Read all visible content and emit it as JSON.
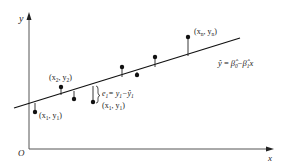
{
  "diagram": {
    "type": "linear-regression-residual-illustration",
    "axes": {
      "x_label": "x",
      "y_label": "y",
      "origin_label": "O"
    },
    "regression_line": {
      "equation": "ŷ = β̂₀−β̂₁x",
      "equation_parts": {
        "yhat": "ŷ",
        "eq": " = ",
        "b0": "β̂",
        "b0_sub": "0",
        "minus": "−",
        "b1": "β̂",
        "b1_sub": "1",
        "x": "x"
      }
    },
    "point_labels": {
      "p1": {
        "open": "(x",
        "sub1": "1",
        "mid": ", y",
        "sub2": "1",
        "close": ")"
      },
      "p2": {
        "open": "(x",
        "sub1": "2",
        "mid": ", y",
        "sub2": "2",
        "close": ")"
      },
      "pi": {
        "open": "(x",
        "sub1": "1",
        "mid": ", y",
        "sub2": "1",
        "close": ")"
      },
      "pn": {
        "open": "(x",
        "sub1": "n",
        "mid": ", y",
        "sub2": "n",
        "close": ")"
      }
    },
    "residual_label": {
      "e": "e",
      "e_sub": "1",
      "eq": "= y",
      "y_sub": "1",
      "minus": "−ŷ",
      "yhat_sub": "1"
    },
    "points_count": 8,
    "colors": {
      "ink": "#222222",
      "axis": "#555555",
      "background": "#ffffff"
    }
  }
}
